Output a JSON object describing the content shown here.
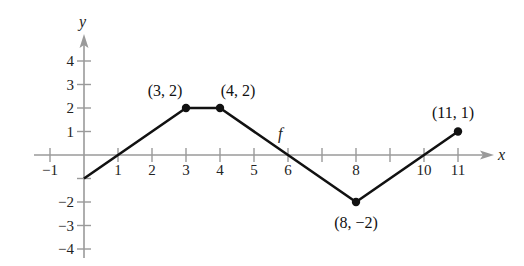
{
  "chart_data": {
    "type": "line",
    "title": "",
    "xlabel": "x",
    "ylabel": "y",
    "function_label": "f",
    "xlim": [
      -1,
      11
    ],
    "ylim": [
      -4,
      4
    ],
    "grid": false,
    "x_ticks": [
      -1,
      1,
      2,
      3,
      4,
      5,
      6,
      8,
      10,
      11
    ],
    "x_tick_marks": [
      -1,
      1,
      2,
      3,
      4,
      5,
      6,
      7,
      8,
      9,
      10,
      11
    ],
    "y_ticks": [
      4,
      3,
      2,
      1,
      -2,
      -3,
      -4
    ],
    "series": [
      {
        "name": "f",
        "x": [
          0,
          3,
          4,
          8,
          11
        ],
        "y": [
          -1,
          2,
          2,
          -2,
          1
        ]
      }
    ],
    "marked_points": [
      {
        "x": 3,
        "y": 2,
        "label": "(3, 2)"
      },
      {
        "x": 4,
        "y": 2,
        "label": "(4, 2)"
      },
      {
        "x": 8,
        "y": -2,
        "label": "(8, −2)"
      },
      {
        "x": 11,
        "y": 1,
        "label": "(11, 1)"
      }
    ],
    "x_tick_labels": [
      "−1",
      "1",
      "2",
      "3",
      "4",
      "5",
      "6",
      "8",
      "10",
      "11"
    ],
    "y_tick_labels": [
      "4",
      "3",
      "2",
      "1",
      "−2",
      "−3",
      "−4"
    ],
    "colors": {
      "axis": "#9a9a9a",
      "curve": "#111111"
    }
  }
}
